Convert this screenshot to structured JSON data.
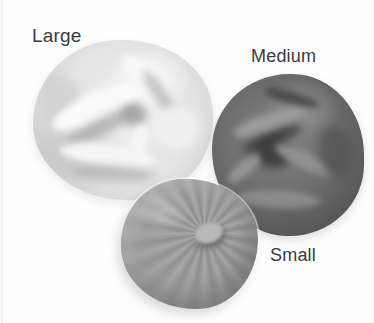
{
  "figure": {
    "background_color": "#fdfdfd",
    "label_color": "#3b3b3b",
    "items": [
      {
        "label": "Large",
        "shade": "light gray",
        "base_color": "#e3e3e3",
        "highlight_color": "#f8f8f8",
        "shadow_color": "#a8a8a8"
      },
      {
        "label": "Medium",
        "shade": "dark gray",
        "base_color": "#6a6a6a",
        "highlight_color": "#9c9c9c",
        "shadow_color": "#343434"
      },
      {
        "label": "Small",
        "shade": "medium gray",
        "base_color": "#9c9c9c",
        "highlight_color": "#b9b9b9",
        "shadow_color": "#6e6e6e"
      }
    ]
  }
}
